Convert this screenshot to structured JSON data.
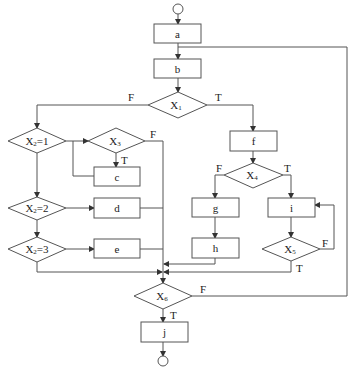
{
  "diagram": {
    "type": "flowchart",
    "nodes": {
      "start": {
        "kind": "terminal"
      },
      "a": {
        "label": "a"
      },
      "b": {
        "label": "b"
      },
      "X1": {
        "label": "X",
        "sub": "1"
      },
      "X2_1": {
        "label": "X",
        "sub": "2",
        "suffix": "=1"
      },
      "X3": {
        "label": "X",
        "sub": "3"
      },
      "c": {
        "label": "c"
      },
      "X2_2": {
        "label": "X",
        "sub": "2",
        "suffix": "=2"
      },
      "d": {
        "label": "d"
      },
      "X2_3": {
        "label": "X",
        "sub": "2",
        "suffix": "=3"
      },
      "e": {
        "label": "e"
      },
      "f": {
        "label": "f"
      },
      "X4": {
        "label": "X",
        "sub": "4"
      },
      "g": {
        "label": "g"
      },
      "h": {
        "label": "h"
      },
      "i": {
        "label": "i"
      },
      "X5": {
        "label": "X",
        "sub": "5"
      },
      "X6": {
        "label": "X",
        "sub": "6"
      },
      "j": {
        "label": "j"
      },
      "end": {
        "kind": "terminal"
      }
    },
    "edge_labels": {
      "x1_false": "F",
      "x1_true": "T",
      "x3_false": "F",
      "x3_true": "T",
      "x4_false": "F",
      "x4_true": "T",
      "x5_false": "F",
      "x5_true": "T",
      "x6_false": "F",
      "x6_true": "T"
    },
    "edges": [
      [
        "start",
        "a"
      ],
      [
        "a",
        "b"
      ],
      [
        "b",
        "X1"
      ],
      [
        "X1",
        "X2_1",
        "F"
      ],
      [
        "X1",
        "f",
        "T"
      ],
      [
        "X2_1",
        "X3"
      ],
      [
        "X2_1",
        "X2_2"
      ],
      [
        "X3",
        "c",
        "T"
      ],
      [
        "X3",
        "X6",
        "F"
      ],
      [
        "c",
        "X3"
      ],
      [
        "X2_2",
        "d"
      ],
      [
        "X2_2",
        "X2_3"
      ],
      [
        "d",
        "X6"
      ],
      [
        "X2_3",
        "e"
      ],
      [
        "X2_3",
        "X6"
      ],
      [
        "e",
        "X6"
      ],
      [
        "f",
        "X4"
      ],
      [
        "X4",
        "g",
        "F"
      ],
      [
        "X4",
        "i",
        "T"
      ],
      [
        "g",
        "h"
      ],
      [
        "h",
        "X6"
      ],
      [
        "i",
        "X5"
      ],
      [
        "X5",
        "i",
        "F"
      ],
      [
        "X5",
        "X6",
        "T"
      ],
      [
        "X6",
        "b",
        "F"
      ],
      [
        "X6",
        "j",
        "T"
      ],
      [
        "j",
        "end"
      ]
    ]
  }
}
